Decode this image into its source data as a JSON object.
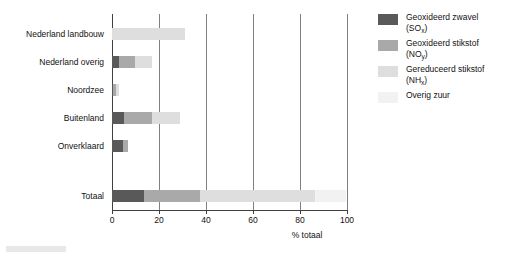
{
  "chart_data": {
    "type": "bar",
    "orientation": "horizontal",
    "stacked": true,
    "title": "",
    "xlabel": "% totaal",
    "ylabel": "",
    "xlim": [
      0,
      100
    ],
    "xticks": [
      0,
      20,
      40,
      60,
      80,
      100
    ],
    "grid": "vertical",
    "legend_position": "right",
    "categories": [
      "Nederland landbouw",
      "Nederland overig",
      "Noordzee",
      "Buitenland",
      "Onverklaard",
      "Totaal"
    ],
    "series": [
      {
        "name": "Geoxideerd zwavel (SOx)",
        "color": "#595959",
        "values": [
          0,
          3,
          0.4,
          5,
          4.5,
          13.5
        ]
      },
      {
        "name": "Geoxideerd stikstof (NOy)",
        "color": "#a9a9a9",
        "values": [
          0,
          7,
          1.2,
          12,
          2.3,
          24
        ]
      },
      {
        "name": "Gereduceerd stikstof (NHx)",
        "color": "#dedede",
        "values": [
          31,
          7,
          1.4,
          12,
          0,
          49
        ]
      },
      {
        "name": "Overig zuur",
        "color": "#f2f2f2",
        "values": [
          0,
          0,
          0,
          0,
          0,
          13
        ]
      }
    ]
  },
  "legend": {
    "items": [
      {
        "label": "Geoxideerd zwavel",
        "formula_pre": "(SO",
        "formula_sub": "x",
        "formula_post": ")",
        "color": "#595959"
      },
      {
        "label": "Geoxideerd stikstof",
        "formula_pre": "(NO",
        "formula_sub": "y",
        "formula_post": ")",
        "color": "#a9a9a9"
      },
      {
        "label": "Gereduceerd stikstof",
        "formula_pre": "(NH",
        "formula_sub": "x",
        "formula_post": ")",
        "color": "#dedede"
      },
      {
        "label": "Overig zuur",
        "formula_pre": "",
        "formula_sub": "",
        "formula_post": "",
        "color": "#f2f2f2"
      }
    ]
  },
  "axis": {
    "title": "% totaal",
    "tick_labels": [
      "0",
      "20",
      "40",
      "60",
      "80",
      "100"
    ]
  }
}
